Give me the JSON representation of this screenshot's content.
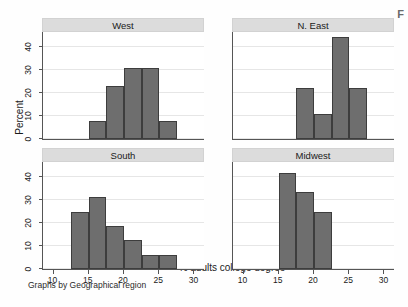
{
  "figure": {
    "ylabel": "Percent",
    "xlabel": "% adults college degree",
    "caption": "Graphs by Geographical region",
    "corner_artifact": "F"
  },
  "axes": {
    "y_ticks": [
      0,
      10,
      20,
      30,
      40
    ],
    "y_tick_labels": [
      "0",
      "10",
      "20",
      "30",
      "40"
    ],
    "ylim": [
      0,
      47
    ],
    "x_ticks": [
      10,
      15,
      20,
      25,
      30
    ],
    "x_tick_labels": [
      "10",
      "15",
      "20",
      "25",
      "30"
    ],
    "xlim": [
      8.5,
      31.5
    ],
    "grid": "horizontal",
    "bar_color": "#6e6e6e",
    "bar_edge_color": "#3d3d3d",
    "panel_header_color": "#dcdcdc"
  },
  "chart_data": {
    "type": "bar",
    "title": "",
    "xlabel": "% adults college degree",
    "ylabel": "Percent",
    "xlim": [
      8.5,
      31.5
    ],
    "ylim": [
      0,
      47
    ],
    "grid": true,
    "legend": "none",
    "layout": "2x2 small multiples",
    "facet_variable": "Geographical region",
    "panels": [
      {
        "label": "West",
        "position": "top-left",
        "bin_width": 2.5,
        "bin_starts": [
          15.0,
          17.5,
          20.0,
          22.5,
          25.0
        ],
        "bin_ends": [
          17.5,
          20.0,
          22.5,
          25.0,
          27.5
        ],
        "values": [
          7.7,
          23.1,
          30.8,
          30.8,
          7.7
        ]
      },
      {
        "label": "N. East",
        "position": "top-right",
        "bin_width": 2.5,
        "bin_starts": [
          17.5,
          20.0,
          22.5,
          25.0
        ],
        "bin_ends": [
          20.0,
          22.5,
          25.0,
          27.5
        ],
        "values": [
          22.2,
          11.1,
          44.4,
          22.2
        ]
      },
      {
        "label": "South",
        "position": "bottom-left",
        "bin_width": 2.5,
        "bin_starts": [
          12.5,
          15.0,
          17.5,
          20.0,
          22.5,
          25.0
        ],
        "bin_ends": [
          15.0,
          17.5,
          20.0,
          22.5,
          25.0,
          27.5
        ],
        "values": [
          25.0,
          31.3,
          18.8,
          12.5,
          6.3,
          6.3
        ]
      },
      {
        "label": "Midwest",
        "position": "bottom-right",
        "bin_width": 2.5,
        "bin_starts": [
          15.0,
          17.5,
          20.0
        ],
        "bin_ends": [
          17.5,
          20.0,
          22.5
        ],
        "values": [
          41.7,
          33.3,
          25.0
        ]
      }
    ]
  }
}
